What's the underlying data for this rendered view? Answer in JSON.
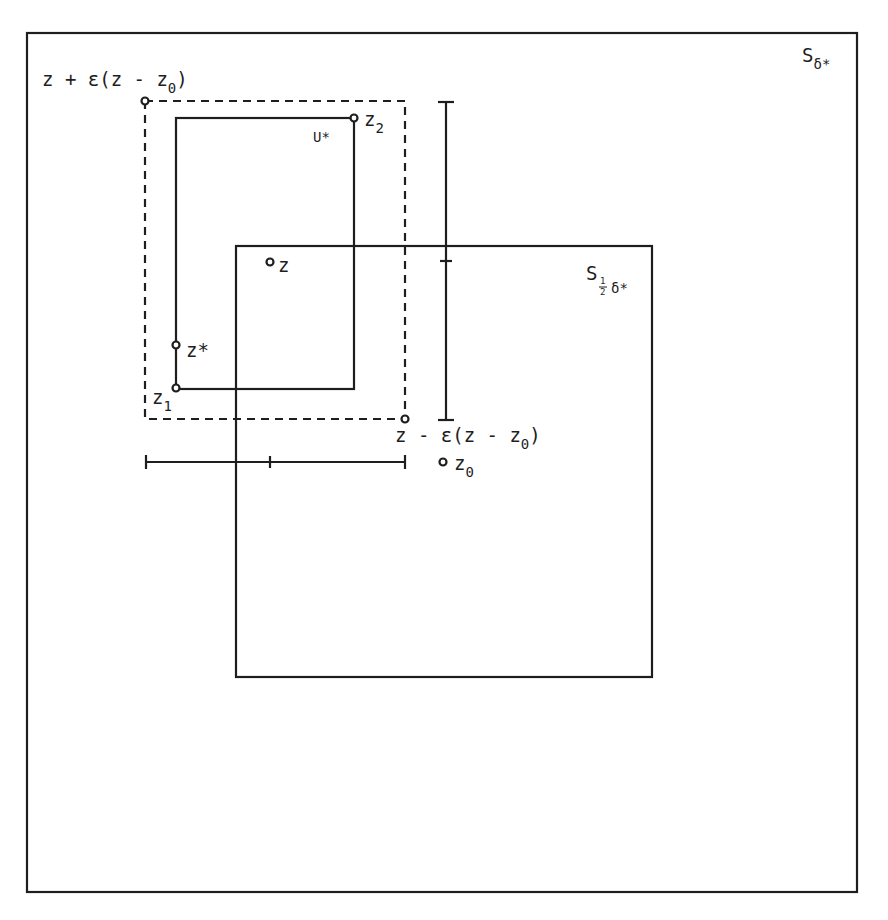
{
  "figure": {
    "stroke_color": "#1e1e1e",
    "background": "#ffffff",
    "regions": {
      "outer_square": {
        "label": "S",
        "subscript": "δ*"
      },
      "half_square": {
        "label": "S",
        "subscript_fraction_num": "1",
        "subscript_fraction_den": "2",
        "subscript_rest": "δ*"
      },
      "neighborhood": {
        "label": "U*"
      }
    },
    "points": {
      "top_left_corner": {
        "label": "z + ε(z - z",
        "subscript": "0",
        "suffix": ")"
      },
      "bottom_right_corner": {
        "label": "z - ε(z - z",
        "subscript": "0",
        "suffix": ")"
      },
      "z": {
        "label": "z"
      },
      "z_star": {
        "label": "z*"
      },
      "z1": {
        "label": "z",
        "subscript": "1"
      },
      "z2": {
        "label": "z",
        "subscript": "2"
      },
      "z0": {
        "label": "z",
        "subscript": "0"
      }
    }
  }
}
